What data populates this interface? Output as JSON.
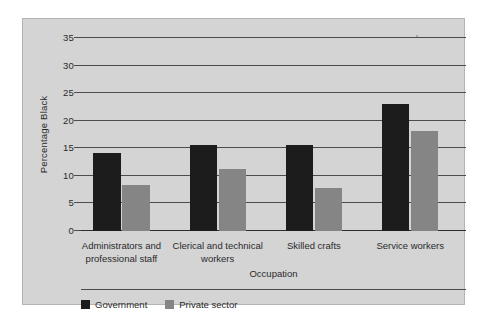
{
  "chart_data": {
    "type": "bar",
    "title": "",
    "xlabel": "Occupation",
    "ylabel": "Percentage Black",
    "categories": [
      "Administrators and professional staff",
      "Clerical and technical workers",
      "Skilled crafts",
      "Service workers"
    ],
    "series": [
      {
        "name": "Government",
        "color": "#1c1c1c",
        "values": [
          14.2,
          15.6,
          15.6,
          23.1
        ]
      },
      {
        "name": "Private sector",
        "color": "#858585",
        "values": [
          8.3,
          11.3,
          7.8,
          18.2
        ]
      }
    ],
    "ylim": [
      0,
      35
    ],
    "ytick_step": 5,
    "yticks": [
      "35",
      "30",
      "25",
      "20",
      "15",
      "10",
      "5",
      "0"
    ],
    "grid": true,
    "legend_position": "bottom-left"
  },
  "figure": {
    "background_color": "#d4d4d4",
    "gridline_color": "#4c4c4c",
    "text_color": "#2b2b2b"
  }
}
